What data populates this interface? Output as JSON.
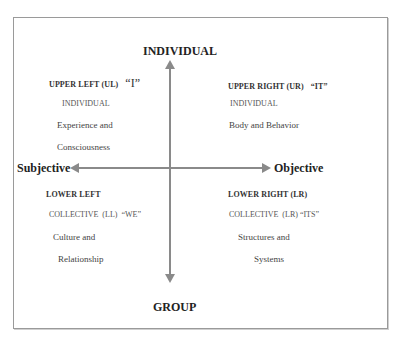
{
  "diagram": {
    "axes": {
      "top": "INDIVIDUAL",
      "bottom": "GROUP",
      "left": "Subjective",
      "right": "Objective"
    },
    "quadrants": {
      "upper_left": {
        "heading": "UPPER LEFT (UL)",
        "quote": "“I”",
        "type": "INDIVIDUAL",
        "line1": "Experience and",
        "line2": "Consciousness"
      },
      "upper_right": {
        "heading": "UPPER RIGHT (UR)",
        "quote": "“IT”",
        "type": "INDIVIDUAL",
        "line1": "Body and Behavior"
      },
      "lower_left": {
        "heading": "LOWER LEFT",
        "type": "COLLECTIVE  (LL)  “WE”",
        "line1": "Culture and",
        "line2": "Relationship"
      },
      "lower_right": {
        "heading": "LOWER RIGHT (LR)",
        "type": "COLLECTIVE  (LR) “ITS”",
        "line1": "Structures and",
        "line2": "Systems"
      }
    },
    "colors": {
      "arrow": "#8a8a8a",
      "frame": "#9a9a9a"
    }
  }
}
